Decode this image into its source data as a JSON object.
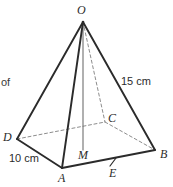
{
  "figure": {
    "kind": "square-pyramid",
    "stray_text": "of",
    "colors": {
      "background": "#ffffff",
      "solid_edge": "#2b2b2b",
      "hidden_edge": "#8d8d8d",
      "axis_line": "#6f6f6f",
      "label_text": "#2b2b2b"
    },
    "vertices": [
      {
        "id": "O",
        "label": "O",
        "x": 83,
        "y": 22
      },
      {
        "id": "A",
        "label": "A",
        "x": 62,
        "y": 168
      },
      {
        "id": "B",
        "label": "B",
        "x": 155,
        "y": 150
      },
      {
        "id": "C",
        "label": "C",
        "x": 105,
        "y": 122
      },
      {
        "id": "D",
        "label": "D",
        "x": 17,
        "y": 139
      },
      {
        "id": "M",
        "label": "M",
        "x": 83,
        "y": 148
      },
      {
        "id": "E",
        "label": "E",
        "x": 113,
        "y": 162
      }
    ],
    "solid_edges": [
      {
        "name": "edge-O-D",
        "from": "O",
        "to": "D"
      },
      {
        "name": "edge-O-A",
        "from": "O",
        "to": "A"
      },
      {
        "name": "edge-O-B",
        "from": "O",
        "to": "B"
      },
      {
        "name": "edge-D-A",
        "from": "D",
        "to": "A"
      },
      {
        "name": "edge-A-B",
        "from": "A",
        "to": "B"
      }
    ],
    "hidden_edges": [
      {
        "name": "edge-O-C",
        "from": "O",
        "to": "C"
      },
      {
        "name": "edge-D-C",
        "from": "D",
        "to": "C"
      },
      {
        "name": "edge-C-B",
        "from": "C",
        "to": "B"
      }
    ],
    "height_line": {
      "name": "height-O-M",
      "from": "O",
      "to": "M"
    },
    "tick_marks": [
      {
        "name": "tick-on-AB-at-E",
        "x": 113,
        "y": 162
      }
    ],
    "measurements": [
      {
        "id": "slant",
        "label": "15 cm",
        "edge": "edge-O-B"
      },
      {
        "id": "base",
        "label": "10 cm",
        "edge": "edge-D-A"
      }
    ]
  }
}
